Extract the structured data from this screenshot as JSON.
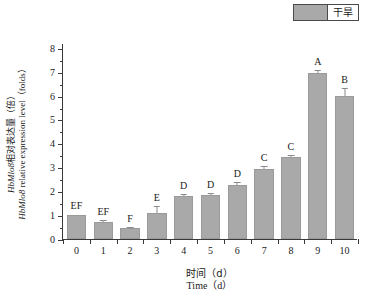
{
  "legend": {
    "entries": [
      {
        "label": "干旱",
        "color": "#a9a9a9"
      }
    ]
  },
  "axes": {
    "y_title_line1": "HbMlo8相对表达量（倍）",
    "y_title_line2": "HbMlo8 relative expression level（folds）",
    "x_title_line1": "时间（d）",
    "x_title_line2": "Time（d）"
  },
  "chart_data": {
    "type": "bar",
    "title": "",
    "subtitle": "",
    "xlabel": "时间（d） / Time（d）",
    "ylabel": "HbMlo8相对表达量（倍） / HbMlo8 relative expression level（folds）",
    "categories": [
      "0",
      "1",
      "2",
      "3",
      "4",
      "5",
      "6",
      "7",
      "8",
      "9",
      "10"
    ],
    "values": [
      1.0,
      0.7,
      0.45,
      1.1,
      1.78,
      1.83,
      2.27,
      2.93,
      3.43,
      6.95,
      6.0
    ],
    "errors": [
      0.0,
      0.05,
      0.03,
      0.22,
      0.07,
      0.07,
      0.06,
      0.08,
      0.04,
      0.1,
      0.28
    ],
    "point_labels": [
      "EF",
      "EF",
      "F",
      "E",
      "D",
      "D",
      "D",
      "C",
      "C",
      "A",
      "B"
    ],
    "series": [
      {
        "name": "干旱",
        "color": "#a9a9a9",
        "values": [
          1.0,
          0.7,
          0.45,
          1.1,
          1.78,
          1.83,
          2.27,
          2.93,
          3.43,
          6.95,
          6.0
        ]
      }
    ],
    "ylim": [
      0,
      8.2
    ],
    "yticks": [
      0,
      1,
      2,
      3,
      4,
      5,
      6,
      7,
      8
    ],
    "ytick_labels": [
      "0",
      "1",
      "2",
      "3",
      "4",
      "5",
      "6",
      "7",
      "8"
    ],
    "y_minor_ticks": [
      0.5,
      1.5,
      2.5,
      3.5,
      4.5,
      5.5,
      6.5,
      7.5
    ],
    "xtick_labels": [
      "0",
      "1",
      "2",
      "3",
      "4",
      "5",
      "6",
      "7",
      "8",
      "9",
      "10"
    ],
    "grid": false,
    "legend_position": "top-right",
    "bar_color": "#a9a9a9",
    "axis_color": "#3a3a3a"
  }
}
